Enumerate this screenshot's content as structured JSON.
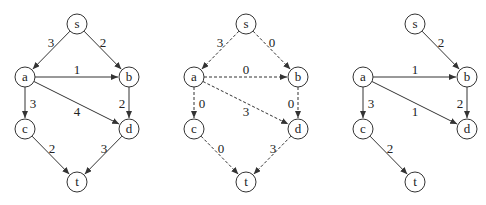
{
  "colors": {
    "stroke": "#333333",
    "background": "#ffffff",
    "text": "#222222"
  },
  "node_radius": 10,
  "graphs": [
    {
      "id": "network",
      "style": "solid",
      "nodes": [
        {
          "id": "s",
          "label": "s",
          "x": 77,
          "y": 24
        },
        {
          "id": "a",
          "label": "a",
          "x": 25,
          "y": 77
        },
        {
          "id": "b",
          "label": "b",
          "x": 129,
          "y": 77
        },
        {
          "id": "c",
          "label": "c",
          "x": 25,
          "y": 129
        },
        {
          "id": "d",
          "label": "d",
          "x": 129,
          "y": 129
        },
        {
          "id": "t",
          "label": "t",
          "x": 77,
          "y": 182
        }
      ],
      "edges": [
        {
          "from": "s",
          "to": "a",
          "label": "3",
          "lx": 51,
          "ly": 42
        },
        {
          "from": "s",
          "to": "b",
          "label": "2",
          "lx": 103,
          "ly": 42
        },
        {
          "from": "a",
          "to": "b",
          "label": "1",
          "lx": 77,
          "ly": 69
        },
        {
          "from": "a",
          "to": "d",
          "label": "4",
          "lx": 77,
          "ly": 111
        },
        {
          "from": "a",
          "to": "c",
          "label": "3",
          "lx": 33,
          "ly": 103
        },
        {
          "from": "b",
          "to": "d",
          "label": "2",
          "lx": 122,
          "ly": 103
        },
        {
          "from": "c",
          "to": "t",
          "label": "2",
          "lx": 52,
          "ly": 148
        },
        {
          "from": "d",
          "to": "t",
          "label": "3",
          "lx": 104,
          "ly": 148
        }
      ]
    },
    {
      "id": "flow",
      "style": "dashed",
      "nodes": [
        {
          "id": "s",
          "label": "s",
          "x": 246,
          "y": 24
        },
        {
          "id": "a",
          "label": "a",
          "x": 194,
          "y": 77
        },
        {
          "id": "b",
          "label": "b",
          "x": 298,
          "y": 77
        },
        {
          "id": "c",
          "label": "c",
          "x": 194,
          "y": 129
        },
        {
          "id": "d",
          "label": "d",
          "x": 298,
          "y": 129
        },
        {
          "id": "t",
          "label": "t",
          "x": 246,
          "y": 182
        }
      ],
      "edges": [
        {
          "from": "s",
          "to": "a",
          "label": "3",
          "lx": 220,
          "ly": 42
        },
        {
          "from": "s",
          "to": "b",
          "label": "0",
          "lx": 272,
          "ly": 42
        },
        {
          "from": "a",
          "to": "b",
          "label": "0",
          "lx": 246,
          "ly": 69
        },
        {
          "from": "a",
          "to": "d",
          "label": "3",
          "lx": 246,
          "ly": 111
        },
        {
          "from": "a",
          "to": "c",
          "label": "0",
          "lx": 202,
          "ly": 103
        },
        {
          "from": "b",
          "to": "d",
          "label": "0",
          "lx": 291,
          "ly": 103
        },
        {
          "from": "c",
          "to": "t",
          "label": "0",
          "lx": 221,
          "ly": 148
        },
        {
          "from": "d",
          "to": "t",
          "label": "3",
          "lx": 273,
          "ly": 148
        }
      ]
    },
    {
      "id": "residual",
      "style": "solid",
      "nodes": [
        {
          "id": "s",
          "label": "s",
          "x": 415,
          "y": 24
        },
        {
          "id": "a",
          "label": "a",
          "x": 363,
          "y": 77
        },
        {
          "id": "b",
          "label": "b",
          "x": 467,
          "y": 77
        },
        {
          "id": "c",
          "label": "c",
          "x": 363,
          "y": 129
        },
        {
          "id": "d",
          "label": "d",
          "x": 467,
          "y": 129
        },
        {
          "id": "t",
          "label": "t",
          "x": 415,
          "y": 182
        }
      ],
      "edges": [
        {
          "from": "s",
          "to": "b",
          "label": "2",
          "lx": 441,
          "ly": 42
        },
        {
          "from": "a",
          "to": "b",
          "label": "1",
          "lx": 415,
          "ly": 69
        },
        {
          "from": "a",
          "to": "d",
          "label": "1",
          "lx": 415,
          "ly": 111
        },
        {
          "from": "a",
          "to": "c",
          "label": "3",
          "lx": 371,
          "ly": 103
        },
        {
          "from": "b",
          "to": "d",
          "label": "2",
          "lx": 460,
          "ly": 103
        },
        {
          "from": "c",
          "to": "t",
          "label": "2",
          "lx": 390,
          "ly": 148
        }
      ]
    }
  ]
}
